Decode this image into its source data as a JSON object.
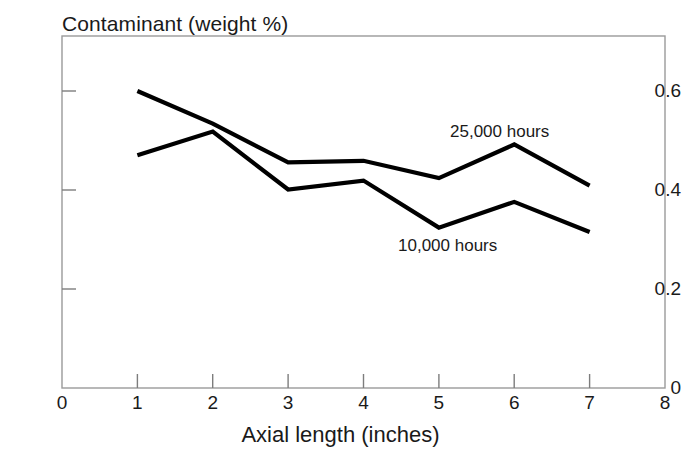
{
  "chart_data": {
    "type": "line",
    "title": "Contaminant (weight %)",
    "xlabel": "Axial length (inches)",
    "ylabel": "",
    "x": [
      1,
      2,
      3,
      4,
      5,
      6,
      7
    ],
    "xlim": [
      0,
      8
    ],
    "ylim": [
      0,
      0.7
    ],
    "xticks": [
      "0",
      "1",
      "2",
      "3",
      "4",
      "5",
      "6",
      "7",
      "8"
    ],
    "yticks": [
      "0",
      "0.2",
      "0.4",
      "0.6"
    ],
    "ytick_values": [
      0,
      0.2,
      0.4,
      0.6
    ],
    "grid": false,
    "legend_position": "inline-annotation",
    "line_color": "#000000",
    "frame_color": "#808080",
    "series": [
      {
        "name": "25,000 hours",
        "values": [
          0.6,
          0.534,
          0.456,
          0.459,
          0.424,
          0.492,
          0.409
        ],
        "annotation": "25,000 hours"
      },
      {
        "name": "10,000 hours",
        "values": [
          0.47,
          0.518,
          0.401,
          0.419,
          0.324,
          0.376,
          0.315
        ],
        "annotation": "10,000 hours"
      }
    ]
  },
  "chart": {
    "title": "Contaminant (weight %)",
    "xlabel": "Axial length (inches)",
    "yticks": [
      {
        "label": "0.6"
      },
      {
        "label": "0.4"
      },
      {
        "label": "0.2"
      },
      {
        "label": "0"
      }
    ],
    "xticks": [
      {
        "label": "0"
      },
      {
        "label": "1"
      },
      {
        "label": "2"
      },
      {
        "label": "3"
      },
      {
        "label": "4"
      },
      {
        "label": "5"
      },
      {
        "label": "6"
      },
      {
        "label": "7"
      },
      {
        "label": "8"
      }
    ],
    "annotations": [
      {
        "label": "25,000 hours"
      },
      {
        "label": "10,000 hours"
      }
    ]
  }
}
